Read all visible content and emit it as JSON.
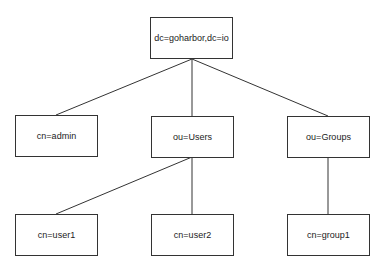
{
  "diagram": {
    "type": "tree",
    "colors": {
      "line": "#333333",
      "border": "#333333",
      "text": "#222222",
      "background": "#ffffff"
    },
    "nodes": [
      {
        "id": "root",
        "label": "dc=goharbor,dc=io",
        "x": 150,
        "y": 17
      },
      {
        "id": "admin",
        "label": "cn=admin",
        "x": 15,
        "y": 115
      },
      {
        "id": "users",
        "label": "ou=Users",
        "x": 151,
        "y": 116
      },
      {
        "id": "groups",
        "label": "ou=Groups",
        "x": 287,
        "y": 116
      },
      {
        "id": "user1",
        "label": "cn=user1",
        "x": 15,
        "y": 214
      },
      {
        "id": "user2",
        "label": "cn=user2",
        "x": 151,
        "y": 214
      },
      {
        "id": "group1",
        "label": "cn=group1",
        "x": 287,
        "y": 214
      }
    ],
    "edges": [
      {
        "from": "root",
        "to": "admin"
      },
      {
        "from": "root",
        "to": "users"
      },
      {
        "from": "root",
        "to": "groups"
      },
      {
        "from": "users",
        "to": "user1"
      },
      {
        "from": "users",
        "to": "user2"
      },
      {
        "from": "groups",
        "to": "group1"
      }
    ]
  }
}
